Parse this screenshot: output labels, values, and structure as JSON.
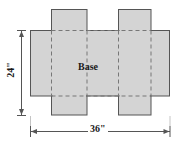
{
  "figure": {
    "labels": {
      "base": "Base",
      "height_dimension": "24\"",
      "width_dimension": "36\""
    },
    "colors": {
      "fill": "#d4d4d4",
      "outline": "#555555",
      "fold_line": "#777777",
      "background": "#ffffff",
      "text": "#1a1a1a"
    },
    "dimensions": {
      "overall_width_value": 36,
      "overall_height_value": 24,
      "units": "inches"
    },
    "geometry": {
      "body_left": 30,
      "body_right": 170,
      "body_top": 30,
      "body_bottom": 96,
      "flap_top_y": 9,
      "flap_bottom_y": 115,
      "flap1_left": 51,
      "flap1_right": 87,
      "flap2_left": 118,
      "flap2_right": 151,
      "fold_x_left": 51,
      "fold_x_mid_left": 87,
      "fold_x_mid_right": 118,
      "fold_x_right": 151,
      "vertical_dim_x": 21,
      "horizontal_dim_y": 131
    }
  }
}
